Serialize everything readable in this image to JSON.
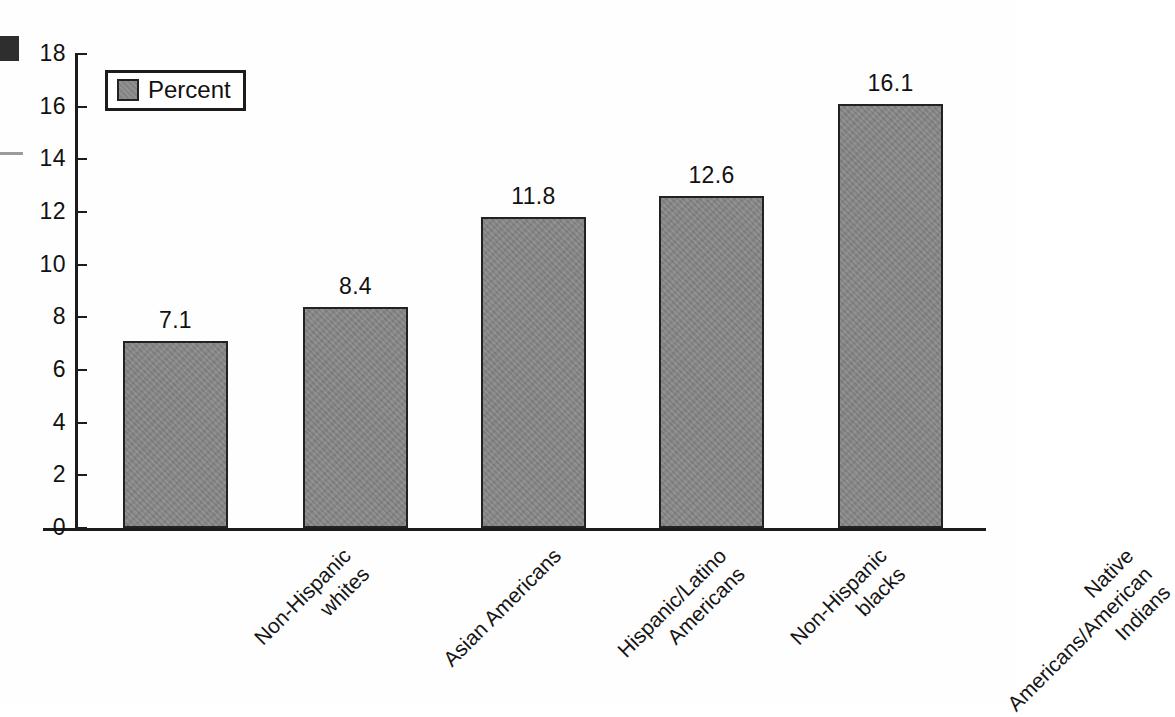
{
  "chart_data": {
    "type": "bar",
    "title": "",
    "subtitle": "",
    "xlabel": "",
    "ylabel": "",
    "ylim": [
      0,
      18
    ],
    "ytick_values": [
      0,
      2,
      4,
      6,
      8,
      10,
      12,
      14,
      16,
      18
    ],
    "ytick_labels": [
      "0",
      "2",
      "4",
      "6",
      "8",
      "10",
      "12",
      "14",
      "16",
      "18"
    ],
    "grid": false,
    "legend_position": "top-left",
    "categories": [
      "Non-Hispanic whites",
      "Asian Americans",
      "Hispanic/Latino Americans",
      "Non-Hispanic blacks",
      "Native Americans/American Indians"
    ],
    "category_label_lines": [
      [
        "Non-Hispanic",
        "whites"
      ],
      [
        "Asian Americans"
      ],
      [
        "Hispanic/Latino",
        "Americans"
      ],
      [
        "Non-Hispanic",
        "blacks"
      ],
      [
        "Native",
        "Americans/American",
        "Indians"
      ]
    ],
    "values": [
      7.1,
      8.4,
      11.8,
      12.6,
      16.1
    ],
    "value_labels": [
      "7.1",
      "8.4",
      "11.8",
      "12.6",
      "16.1"
    ],
    "series": [
      {
        "name": "Percent",
        "values": [
          7.1,
          8.4,
          11.8,
          12.6,
          16.1
        ]
      }
    ]
  },
  "legend": {
    "label": "Percent",
    "swatch_color": "#8a8a8a",
    "border_color": "#1c1c1c"
  },
  "axes": {
    "axis_color": "#1c1c1c",
    "bar_fill": "#878787",
    "bar_border": "#222222"
  },
  "artifacts": {
    "blob_color": "#2e2e2e",
    "line_color": "#9b9b9b"
  }
}
